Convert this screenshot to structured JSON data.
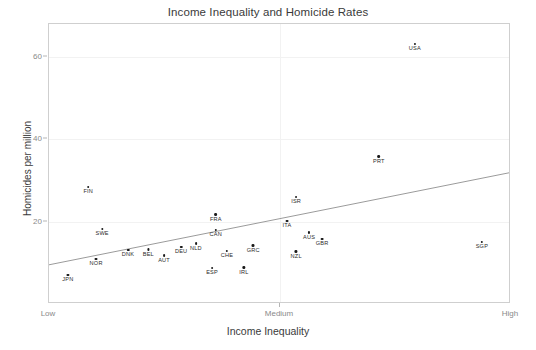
{
  "chart_data": {
    "type": "scatter",
    "title": "Income Inequality and Homicide Rates",
    "xlabel": "Income Inequality",
    "ylabel": "Homicides per million",
    "xlim": [
      0,
      1
    ],
    "ylim": [
      0,
      68
    ],
    "grid": true,
    "legend": "none",
    "x_tick_labels": [
      "Low",
      "Medium",
      "High"
    ],
    "x_tick_values": [
      0,
      0.5,
      1
    ],
    "y_tick_labels": [
      "20",
      "40",
      "60"
    ],
    "y_tick_values": [
      20,
      40,
      60
    ],
    "points": [
      {
        "label": "JPN",
        "x": 0.041,
        "y": 7.0
      },
      {
        "label": "NOR",
        "x": 0.102,
        "y": 10.9
      },
      {
        "label": "FIN",
        "x": 0.085,
        "y": 28.4
      },
      {
        "label": "SWE",
        "x": 0.115,
        "y": 18.2
      },
      {
        "label": "DNK",
        "x": 0.171,
        "y": 13.1
      },
      {
        "label": "BEL",
        "x": 0.215,
        "y": 13.3
      },
      {
        "label": "AUT",
        "x": 0.249,
        "y": 11.8
      },
      {
        "label": "DEU",
        "x": 0.286,
        "y": 13.8
      },
      {
        "label": "NLD",
        "x": 0.318,
        "y": 14.7
      },
      {
        "label": "ESP",
        "x": 0.353,
        "y": 8.7
      },
      {
        "label": "FRA",
        "x": 0.361,
        "y": 21.8
      },
      {
        "label": "CAN",
        "x": 0.361,
        "y": 18.0
      },
      {
        "label": "CHE",
        "x": 0.385,
        "y": 12.9
      },
      {
        "label": "IRL",
        "x": 0.422,
        "y": 8.9
      },
      {
        "label": "GRC",
        "x": 0.442,
        "y": 14.2
      },
      {
        "label": "ITA",
        "x": 0.515,
        "y": 20.2
      },
      {
        "label": "ISR",
        "x": 0.535,
        "y": 26.0
      },
      {
        "label": "NZL",
        "x": 0.535,
        "y": 12.7
      },
      {
        "label": "AUS",
        "x": 0.563,
        "y": 17.3
      },
      {
        "label": "GBR",
        "x": 0.591,
        "y": 15.8
      },
      {
        "label": "PRT",
        "x": 0.714,
        "y": 35.8
      },
      {
        "label": "USA",
        "x": 0.792,
        "y": 63.1
      },
      {
        "label": "SGP",
        "x": 0.937,
        "y": 15.1
      }
    ],
    "trend_line": {
      "x_start": 0,
      "y_start": 9.1,
      "x_end": 1,
      "y_end": 31.6,
      "color": "#9a9a9a"
    },
    "colors": {
      "point": "#1a1a1a",
      "axis": "#cfcfcf",
      "grid": "#f2f2f2",
      "text": "#3a3a3a",
      "tick_text": "#8a8a8a"
    }
  }
}
